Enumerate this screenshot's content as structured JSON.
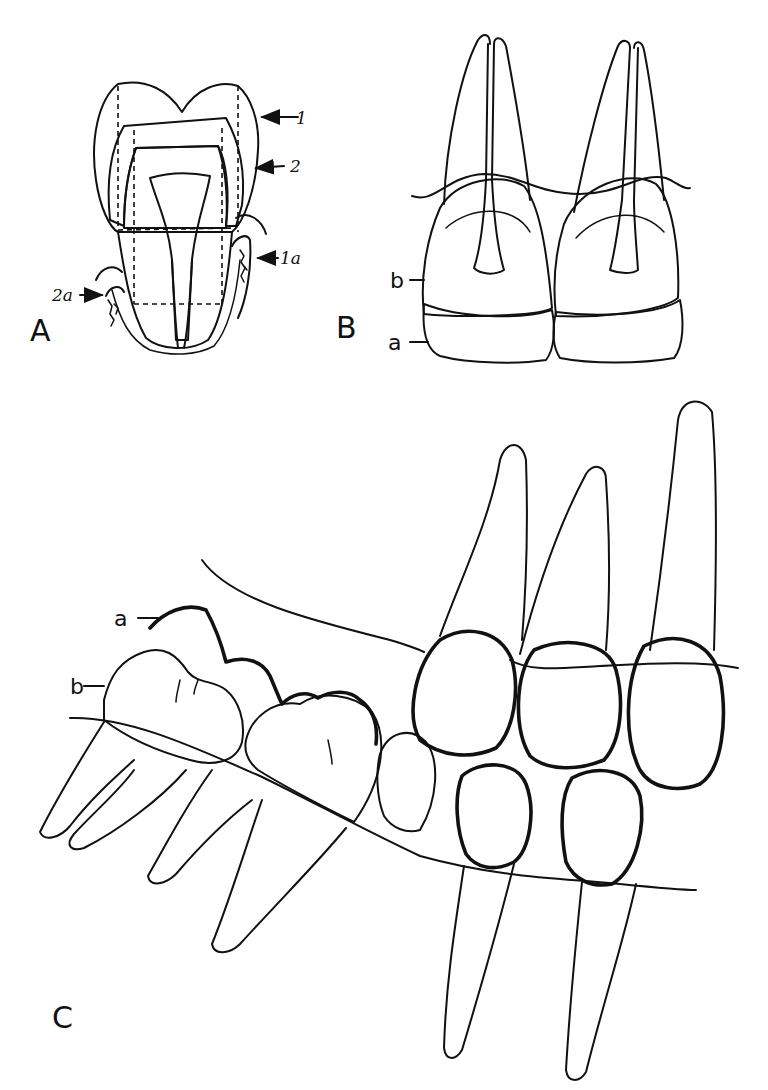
{
  "figure": {
    "type": "dental anatomy line drawing",
    "colors": {
      "ink": "#111111",
      "background": "#ffffff"
    },
    "panels": [
      {
        "id": "A",
        "label": "A",
        "subject": "molar cross-section with crown, pulp and alveolar bone",
        "annotations": [
          {
            "id": "1",
            "text": "1",
            "arrow": "left"
          },
          {
            "id": "2",
            "text": "2",
            "arrow": "left"
          },
          {
            "id": "1a",
            "text": "1a",
            "arrow": "left"
          },
          {
            "id": "2a",
            "text": "2a",
            "arrow": "right"
          }
        ]
      },
      {
        "id": "B",
        "label": "B",
        "subject": "two anterior teeth, labial view, cross-hatched zone",
        "annotations": [
          {
            "id": "b",
            "text": "b"
          },
          {
            "id": "a",
            "text": "a"
          }
        ]
      },
      {
        "id": "C",
        "label": "C",
        "subject": "lateral view of dental arch with upper and lower teeth",
        "annotations": [
          {
            "id": "a",
            "text": "a"
          },
          {
            "id": "b",
            "text": "b"
          }
        ]
      }
    ]
  }
}
